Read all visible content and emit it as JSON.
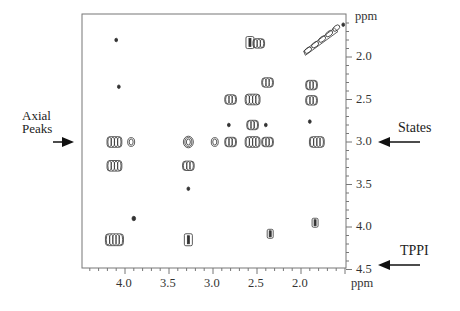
{
  "chart_data": {
    "type": "heatmap",
    "subtype": "2D NMR contour plot",
    "title": "",
    "xlabel": "ppm",
    "ylabel": "ppm",
    "x_axis": {
      "label": "ppm",
      "reversed": true,
      "range": [
        4.49,
        1.49
      ],
      "ticks": [
        4.0,
        3.5,
        3.0,
        2.5,
        2.0
      ],
      "tick_labels": [
        "4.0",
        "3.5",
        "3.0",
        "2.5",
        "2.0"
      ]
    },
    "y_axis": {
      "label": "ppm",
      "position": "right",
      "reversed": true,
      "range": [
        1.49,
        4.5
      ],
      "ticks": [
        2.0,
        2.5,
        3.0,
        3.5,
        4.0,
        4.5
      ],
      "tick_labels": [
        "2.0",
        "2.5",
        "3.0",
        "3.5",
        "4.0",
        "4.5"
      ]
    },
    "grid": false,
    "legend": null,
    "annotations": [
      {
        "text": "Axial Peaks",
        "arrow": "right",
        "points_to_f1_ppm": 3.0,
        "side": "left"
      },
      {
        "text": "States",
        "arrow": "left",
        "points_to_f1_ppm": 3.0,
        "side": "right"
      },
      {
        "text": "TPPI",
        "arrow": "left",
        "points_to_f1_ppm": 4.45,
        "side": "right"
      }
    ],
    "peaks": [
      {
        "f2": 1.6,
        "f1": 1.7,
        "shape": "diagonal",
        "size": 3
      },
      {
        "f2": 4.1,
        "f1": 1.8,
        "shape": "dot",
        "size": 1
      },
      {
        "f2": 2.58,
        "f1": 1.83,
        "shape": "rect",
        "size": 2
      },
      {
        "f2": 2.48,
        "f1": 1.84,
        "shape": "cluster",
        "size": 2
      },
      {
        "f2": 1.52,
        "f1": 1.62,
        "shape": "dot",
        "size": 1
      },
      {
        "f2": 4.07,
        "f1": 2.35,
        "shape": "dot",
        "size": 1
      },
      {
        "f2": 2.38,
        "f1": 2.3,
        "shape": "cluster",
        "size": 2
      },
      {
        "f2": 1.88,
        "f1": 2.33,
        "shape": "cluster",
        "size": 2
      },
      {
        "f2": 2.8,
        "f1": 2.5,
        "shape": "cluster",
        "size": 2
      },
      {
        "f2": 2.55,
        "f1": 2.5,
        "shape": "cluster",
        "size": 3
      },
      {
        "f2": 1.88,
        "f1": 2.51,
        "shape": "cluster",
        "size": 2
      },
      {
        "f2": 2.82,
        "f1": 2.8,
        "shape": "dot",
        "size": 1
      },
      {
        "f2": 2.55,
        "f1": 2.8,
        "shape": "cluster",
        "size": 2
      },
      {
        "f2": 2.4,
        "f1": 2.8,
        "shape": "dot",
        "size": 1
      },
      {
        "f2": 1.9,
        "f1": 2.76,
        "shape": "dot",
        "size": 1
      },
      {
        "f2": 4.12,
        "f1": 3.0,
        "shape": "cluster",
        "size": 3
      },
      {
        "f2": 3.93,
        "f1": 3.0,
        "shape": "circle",
        "size": 1
      },
      {
        "f2": 3.28,
        "f1": 3.0,
        "shape": "circle",
        "size": 2
      },
      {
        "f2": 2.98,
        "f1": 3.0,
        "shape": "circle",
        "size": 1
      },
      {
        "f2": 2.8,
        "f1": 3.0,
        "shape": "cluster",
        "size": 2
      },
      {
        "f2": 2.55,
        "f1": 3.0,
        "shape": "cluster",
        "size": 3
      },
      {
        "f2": 2.38,
        "f1": 3.0,
        "shape": "cluster",
        "size": 2
      },
      {
        "f2": 1.82,
        "f1": 3.0,
        "shape": "cluster",
        "size": 3
      },
      {
        "f2": 4.12,
        "f1": 3.28,
        "shape": "cluster",
        "size": 3
      },
      {
        "f2": 3.28,
        "f1": 3.28,
        "shape": "cluster",
        "size": 2
      },
      {
        "f2": 3.28,
        "f1": 3.55,
        "shape": "dot",
        "size": 1
      },
      {
        "f2": 3.9,
        "f1": 3.9,
        "shape": "dot",
        "size": 2
      },
      {
        "f2": 1.84,
        "f1": 3.95,
        "shape": "rect",
        "size": 1
      },
      {
        "f2": 4.12,
        "f1": 4.15,
        "shape": "cluster",
        "size": 4
      },
      {
        "f2": 3.28,
        "f1": 4.15,
        "shape": "rect",
        "size": 2
      },
      {
        "f2": 2.35,
        "f1": 4.08,
        "shape": "rect",
        "size": 1
      }
    ]
  },
  "labels": {
    "axial_peaks_line1": "Axial",
    "axial_peaks_line2": "Peaks",
    "states": "States",
    "tppi": "TPPI",
    "x_unit": "ppm",
    "y_unit": "ppm",
    "x_ticks": [
      "4.0",
      "3.5",
      "3.0",
      "2.5",
      "2.0"
    ],
    "y_ticks": [
      "2.0",
      "2.5",
      "3.0",
      "3.5",
      "4.0",
      "4.5"
    ]
  },
  "colors": {
    "ink": "#222222",
    "frame": "#666666",
    "contour": "#333333",
    "background": "#ffffff"
  }
}
